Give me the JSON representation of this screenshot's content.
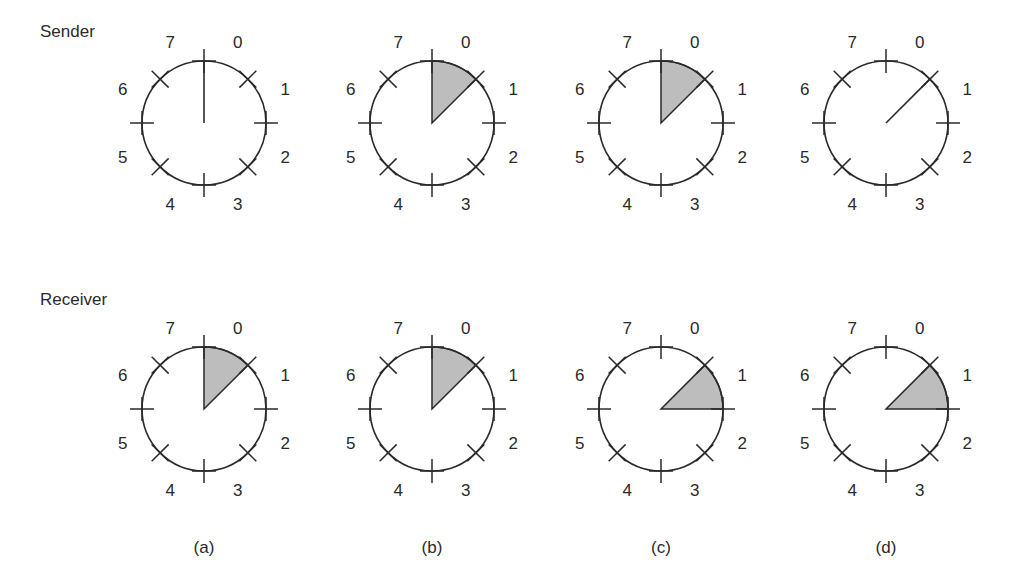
{
  "figure": {
    "row_labels": {
      "sender": "Sender",
      "receiver": "Receiver"
    },
    "sequence_numbers": [
      "0",
      "1",
      "2",
      "3",
      "4",
      "5",
      "6",
      "7"
    ],
    "captions": [
      "(a)",
      "(b)",
      "(c)",
      "(d)"
    ],
    "colors": {
      "stroke": "#2a2a2a",
      "window_fill": "#bdbdbd",
      "background": "#ffffff"
    },
    "panels": [
      {
        "caption": "(a)",
        "sender": {
          "window_slots": [],
          "pointer_line_slot_start": 0
        },
        "receiver": {
          "window_slots": [
            0
          ]
        }
      },
      {
        "caption": "(b)",
        "sender": {
          "window_slots": [
            0
          ]
        },
        "receiver": {
          "window_slots": [
            0
          ]
        }
      },
      {
        "caption": "(c)",
        "sender": {
          "window_slots": [
            0
          ]
        },
        "receiver": {
          "window_slots": [
            1
          ]
        }
      },
      {
        "caption": "(d)",
        "sender": {
          "window_slots": [],
          "pointer_line_slot_start": 1
        },
        "receiver": {
          "window_slots": [
            1
          ]
        }
      }
    ]
  }
}
